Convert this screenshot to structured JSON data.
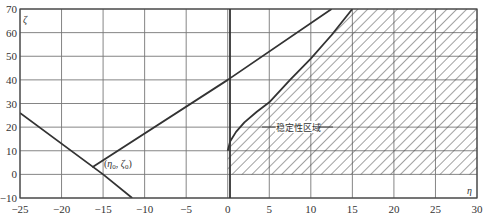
{
  "chart_data": {
    "type": "line",
    "title": "",
    "xlabel": "η",
    "ylabel": "ζ",
    "xlim": [
      -25,
      30
    ],
    "ylim": [
      -10,
      70
    ],
    "grid": true,
    "x_ticks": [
      -25,
      -20,
      -15,
      -10,
      -5,
      0,
      5,
      10,
      15,
      20,
      25,
      30
    ],
    "y_ticks": [
      -10,
      0,
      10,
      20,
      30,
      40,
      50,
      60,
      70
    ],
    "x_tick_labels": [
      "−25",
      "−20",
      "−15",
      "−10",
      "−5",
      "0",
      "5",
      "10",
      "15",
      "20",
      "25",
      "30"
    ],
    "y_tick_labels": [
      "−10",
      "0",
      "10",
      "20",
      "30",
      "40",
      "50",
      "60",
      "70"
    ],
    "series": [
      {
        "name": "upper-line",
        "x": [
          -16.3,
          0,
          12.5
        ],
        "y": [
          3,
          40,
          70
        ]
      },
      {
        "name": "descending-line",
        "x": [
          -25,
          -15,
          -11.5
        ],
        "y": [
          26,
          0,
          -10
        ]
      },
      {
        "name": "stability-boundary",
        "x": [
          0,
          0.3,
          1,
          2,
          3.5,
          5,
          7.5,
          10,
          12.5,
          15
        ],
        "y": [
          10,
          14,
          18,
          22,
          26.5,
          30.5,
          40,
          49,
          59,
          70
        ]
      }
    ],
    "shaded_region": {
      "name": "稳定性区域",
      "pattern": "diagonal-hatch",
      "bounds": "η from boundary curve to 30, ζ from 0 to 70"
    },
    "annotations": [
      {
        "text": "(η₀, ζ₀)",
        "x": -14.5,
        "y": 6
      },
      {
        "text": "稳定性区域",
        "x": 6,
        "y": 20
      }
    ]
  },
  "labels": {
    "region": "稳定性区域",
    "point": "(η₀, ζ₀)",
    "point_eta": "η",
    "point_eta_sub": "0",
    "point_zeta": "ζ",
    "point_zeta_sub": "0",
    "x_axis_var": "η",
    "y_axis_var": "ζ"
  }
}
